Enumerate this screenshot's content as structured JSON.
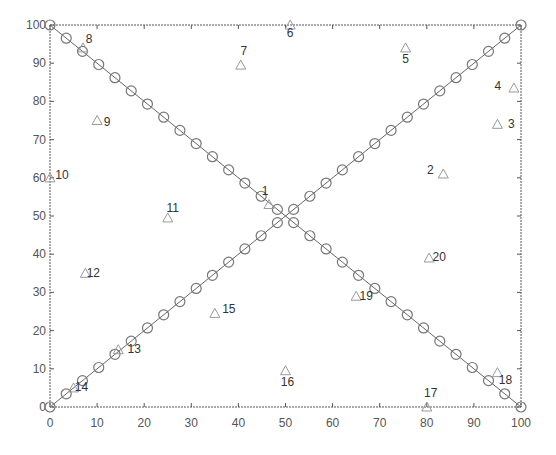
{
  "chart_data": {
    "type": "scatter",
    "title": "",
    "xlabel": "",
    "ylabel": "",
    "xlim": [
      0,
      100
    ],
    "ylim": [
      0,
      100
    ],
    "grid": false,
    "legend": null,
    "x_ticks": [
      0,
      10,
      20,
      30,
      40,
      50,
      60,
      70,
      80,
      90,
      100
    ],
    "y_ticks": [
      0,
      10,
      20,
      30,
      40,
      50,
      60,
      70,
      80,
      90,
      100
    ],
    "series": [
      {
        "name": "diagonal-ascending",
        "marker": "circle",
        "line": true,
        "points_count": 30,
        "from": [
          0,
          0
        ],
        "to": [
          100,
          100
        ]
      },
      {
        "name": "diagonal-descending",
        "marker": "circle",
        "line": true,
        "points_count": 30,
        "from": [
          0,
          100
        ],
        "to": [
          100,
          0
        ]
      },
      {
        "name": "nodes",
        "marker": "triangle",
        "line": false,
        "points": [
          {
            "id": "1",
            "x": 46.5,
            "y": 53
          },
          {
            "id": "2",
            "x": 83.5,
            "y": 61
          },
          {
            "id": "3",
            "x": 95,
            "y": 74
          },
          {
            "id": "4",
            "x": 98.5,
            "y": 83.5
          },
          {
            "id": "5",
            "x": 75.5,
            "y": 94
          },
          {
            "id": "6",
            "x": 51,
            "y": 100
          },
          {
            "id": "7",
            "x": 40.5,
            "y": 89.5
          },
          {
            "id": "8",
            "x": 7,
            "y": 94
          },
          {
            "id": "9",
            "x": 10,
            "y": 75
          },
          {
            "id": "10",
            "x": 0,
            "y": 60
          },
          {
            "id": "11",
            "x": 25,
            "y": 49.5
          },
          {
            "id": "12",
            "x": 7.5,
            "y": 35
          },
          {
            "id": "13",
            "x": 14.5,
            "y": 15
          },
          {
            "id": "14",
            "x": 5,
            "y": 5
          },
          {
            "id": "15",
            "x": 35,
            "y": 24.5
          },
          {
            "id": "16",
            "x": 50,
            "y": 9.5
          },
          {
            "id": "17",
            "x": 80,
            "y": 0
          },
          {
            "id": "18",
            "x": 95,
            "y": 9
          },
          {
            "id": "19",
            "x": 65,
            "y": 29
          },
          {
            "id": "20",
            "x": 80.5,
            "y": 39
          }
        ]
      }
    ],
    "label_offsets": {
      "1": [
        -4,
        -10
      ],
      "2": [
        -13,
        0
      ],
      "3": [
        14,
        4
      ],
      "4": [
        -16,
        2
      ],
      "5": [
        0,
        15
      ],
      "6": [
        0,
        12
      ],
      "7": [
        3,
        -10
      ],
      "8": [
        6,
        -5
      ],
      "9": [
        10,
        5
      ],
      "10": [
        12,
        1
      ],
      "11": [
        5,
        -6
      ],
      "12": [
        8,
        4
      ],
      "13": [
        16,
        3
      ],
      "14": [
        8,
        3
      ],
      "15": [
        14,
        0
      ],
      "16": [
        2,
        15
      ],
      "17": [
        4,
        -10
      ],
      "18": [
        8,
        11
      ],
      "19": [
        10,
        4
      ],
      "20": [
        10,
        3
      ]
    }
  },
  "colors": {
    "axis": "#555555",
    "line": "#666666",
    "circle": "#777777",
    "triangle": "#9a9a9a",
    "label": "#333333",
    "background": "#ffffff"
  }
}
